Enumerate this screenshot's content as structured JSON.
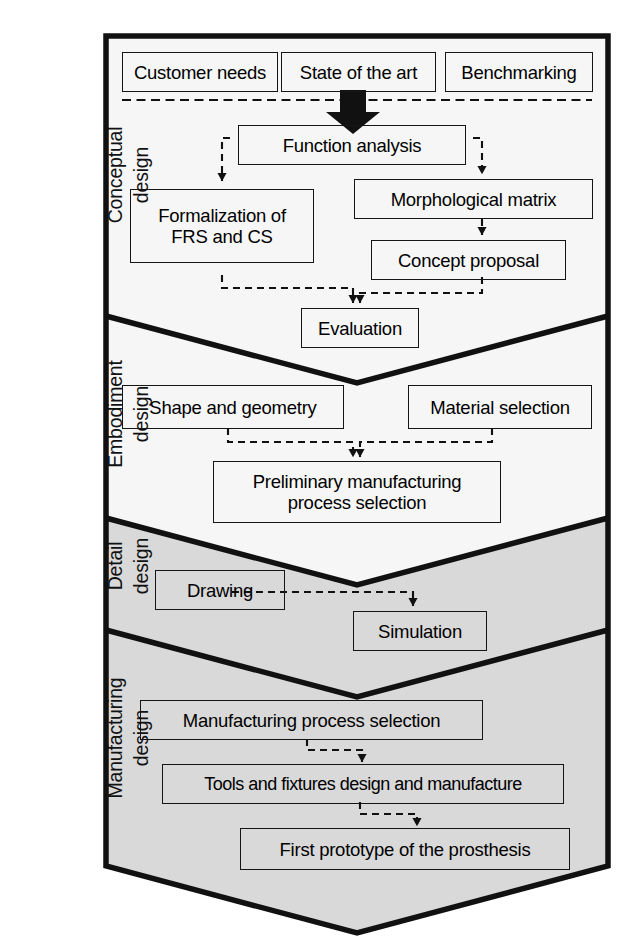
{
  "figure": {
    "outer_border_color": "#111111",
    "band_fill_light": "#f6f6f6",
    "band_fill_gray": "#d9d9d9",
    "box_border_color": "#151515",
    "connector_color": "#111111"
  },
  "stages": [
    {
      "id": "conceptual",
      "label": "Conceptual\ndesign"
    },
    {
      "id": "embodiment",
      "label": "Embodiment\ndesign"
    },
    {
      "id": "detail",
      "label": "Detail\ndesign"
    },
    {
      "id": "manufacturing",
      "label": "Manufacturing\ndesign"
    }
  ],
  "nodes": {
    "customer_needs": "Customer needs",
    "state_of_the_art": "State of the art",
    "benchmarking": "Benchmarking",
    "function_analysis": "Function analysis",
    "formalization": "Formalization of\nFRS and CS",
    "morphological_matrix": "Morphological matrix",
    "concept_proposal": "Concept proposal",
    "evaluation": "Evaluation",
    "shape_and_geometry": "Shape and geometry",
    "material_selection": "Material selection",
    "preliminary_manufacturing": "Preliminary manufacturing\nprocess selection",
    "drawing": "Drawing",
    "simulation": "Simulation",
    "manufacturing_process_selection": "Manufacturing process selection",
    "tools_and_fixtures": "Tools and fixtures design and manufacture",
    "first_prototype": "First prototype of the prosthesis"
  },
  "flows": [
    {
      "from": "inputs-group",
      "to": "function_analysis",
      "style": "block-arrow"
    },
    {
      "from": "function_analysis",
      "to": "formalization",
      "style": "dashed"
    },
    {
      "from": "function_analysis",
      "to": "morphological_matrix",
      "style": "dashed"
    },
    {
      "from": "morphological_matrix",
      "to": "concept_proposal",
      "style": "dashed"
    },
    {
      "from": "formalization",
      "to": "evaluation",
      "style": "dashed"
    },
    {
      "from": "concept_proposal",
      "to": "evaluation",
      "style": "dashed"
    },
    {
      "from": "shape_and_geometry",
      "to": "preliminary_manufacturing",
      "style": "dashed"
    },
    {
      "from": "material_selection",
      "to": "preliminary_manufacturing",
      "style": "dashed"
    },
    {
      "from": "drawing",
      "to": "simulation",
      "style": "dashed"
    },
    {
      "from": "manufacturing_process_selection",
      "to": "tools_and_fixtures",
      "style": "dashed"
    },
    {
      "from": "tools_and_fixtures",
      "to": "first_prototype",
      "style": "dashed"
    }
  ]
}
